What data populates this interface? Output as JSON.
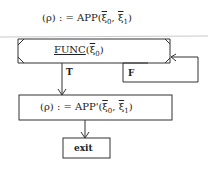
{
  "diagram": {
    "init_statement": {
      "lhs": "(ρ)",
      "op": ": =",
      "func": "APP(",
      "arg0": "ξ",
      "arg0_sub": "0",
      "sep": ", ",
      "arg1": "ξ",
      "arg1_sub": "1",
      "close": ")"
    },
    "decision": {
      "func": "FUNC",
      "open": "(",
      "arg": "ξ",
      "arg_sub": "0",
      "close": ")"
    },
    "true_label": "T",
    "false_label": "F",
    "action": {
      "lhs": "(ρ)",
      "op": ": =",
      "func": "APP'(",
      "arg0": "ξ",
      "arg0_sub": "0",
      "sep": ", ",
      "arg1": "ξ",
      "arg1_sub": "1",
      "close": ")"
    },
    "exit_label": "exit"
  }
}
